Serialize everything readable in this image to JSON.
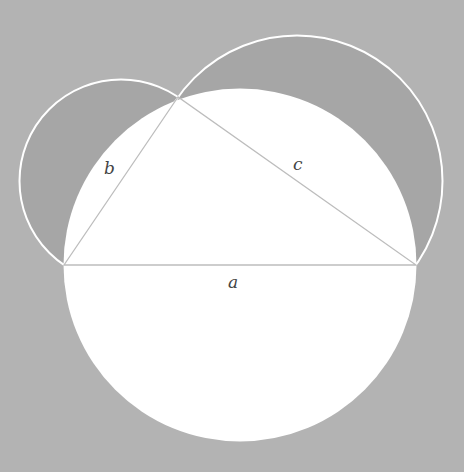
{
  "diagram": {
    "colors": {
      "background": "#b3b3b3",
      "lune_fill": "#a6a6a6",
      "circle_fill": "#ffffff",
      "outline": "#ffffff",
      "triangle_stroke": "#bdbdbd",
      "label": "#444444"
    },
    "vertices": {
      "A": [
        178,
        97
      ],
      "B": [
        64,
        265
      ],
      "C": [
        416,
        265
      ]
    },
    "labels": {
      "a": "a",
      "b": "b",
      "c": "c"
    }
  }
}
